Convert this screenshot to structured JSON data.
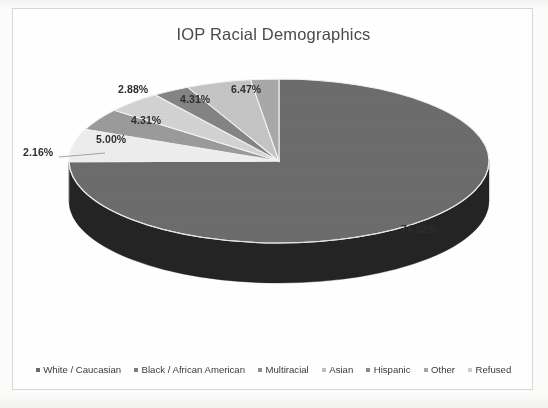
{
  "chart_data": {
    "type": "pie",
    "title": "IOP Racial Demographics",
    "categories": [
      "White / Caucasian",
      "Black / African American",
      "Multiracial",
      "Asian",
      "Hispanic",
      "Other",
      "Refused"
    ],
    "values": [
      74.82,
      6.47,
      4.31,
      4.31,
      2.88,
      5.0,
      2.16
    ],
    "value_labels": [
      "74.82%",
      "6.47%",
      "4.31%",
      "4.31%",
      "2.88%",
      "5.00%",
      "2.16%"
    ],
    "unit": "percent",
    "legend_position": "bottom",
    "three_d": true,
    "start_angle_deg": 0,
    "direction": "clockwise",
    "grid": false,
    "xlabel": "",
    "ylabel": "",
    "slice_colors": [
      "#6c6c6c",
      "#ededed",
      "#9a9a9a",
      "#d2d2d2",
      "#848484",
      "#c4c4c4",
      "#a8a8a8"
    ],
    "side_colors": [
      "#242424",
      "#9e9e9e",
      "#4e4e4e",
      "#8c8c8c",
      "#3e3e3e",
      "#858585",
      "#6a6a6a"
    ]
  },
  "chart": {
    "title": "IOP Racial Demographics",
    "labels": [
      {
        "id": "white-caucasian",
        "text": "74.82%"
      },
      {
        "id": "black-african-american",
        "text": "6.47%"
      },
      {
        "id": "multiracial",
        "text": "4.31%"
      },
      {
        "id": "asian",
        "text": "4.31%"
      },
      {
        "id": "hispanic",
        "text": "2.88%"
      },
      {
        "id": "other",
        "text": "5.00%"
      },
      {
        "id": "refused",
        "text": "2.16%"
      }
    ],
    "legend": [
      {
        "label": "White / Caucasian",
        "color": "#6c6c6c"
      },
      {
        "label": "Black / African American",
        "color": "#ededed"
      },
      {
        "label": "Multiracial",
        "color": "#9a9a9a"
      },
      {
        "label": "Asian",
        "color": "#d2d2d2"
      },
      {
        "label": "Hispanic",
        "color": "#848484"
      },
      {
        "label": "Other",
        "color": "#c4c4c4"
      },
      {
        "label": "Refused",
        "color": "#a8a8a8"
      }
    ]
  }
}
